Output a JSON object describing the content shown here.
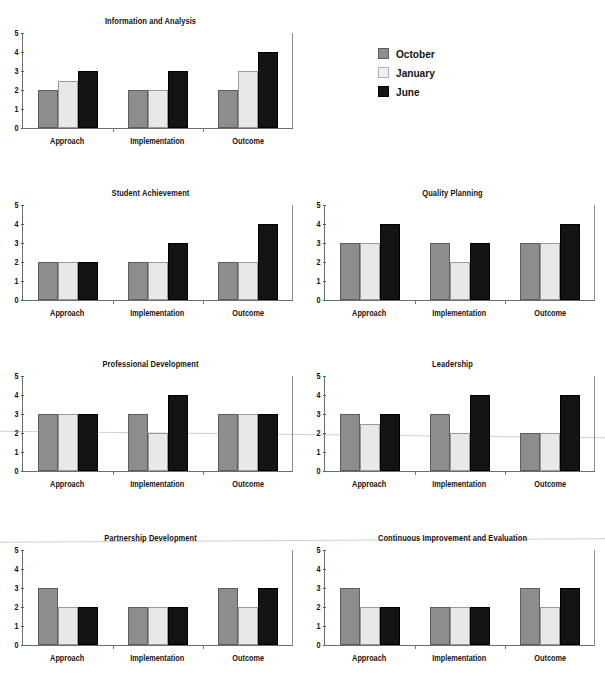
{
  "figure": {
    "series_names": [
      "October",
      "January",
      "June"
    ],
    "categories": [
      "Approach",
      "Implementation",
      "Outcome"
    ],
    "y_ticks": [
      "5",
      "4",
      "3",
      "2",
      "1",
      "0"
    ],
    "colors": {
      "october": "#8d8d8d",
      "january": "#e8e8e8",
      "june": "#141414",
      "axis": "#6d6d6d",
      "text": "#141414",
      "background": "#ffffff"
    }
  },
  "legend": {
    "position": "top-right",
    "items": [
      {
        "label": "October",
        "swatch": "october-swatch"
      },
      {
        "label": "January",
        "swatch": "january-swatch"
      },
      {
        "label": "June",
        "swatch": "june-swatch"
      }
    ]
  },
  "chart_data": [
    {
      "type": "bar",
      "title": "Information and Analysis",
      "categories": [
        "Approach",
        "Implementation",
        "Outcome"
      ],
      "series": [
        {
          "name": "October",
          "values": [
            2,
            2,
            2
          ]
        },
        {
          "name": "January",
          "values": [
            2.5,
            2,
            3
          ]
        },
        {
          "name": "June",
          "values": [
            3,
            3,
            4
          ]
        }
      ],
      "xlabel": "",
      "ylabel": "",
      "ylim": [
        0,
        5
      ],
      "yticks": [
        0,
        1,
        2,
        3,
        4,
        5
      ],
      "grid": false,
      "legend": "external-top-right"
    },
    {
      "type": "bar",
      "title": "Student Achievement",
      "categories": [
        "Approach",
        "Implementation",
        "Outcome"
      ],
      "series": [
        {
          "name": "October",
          "values": [
            2,
            2,
            2
          ]
        },
        {
          "name": "January",
          "values": [
            2,
            2,
            2
          ]
        },
        {
          "name": "June",
          "values": [
            2,
            3,
            4
          ]
        }
      ],
      "xlabel": "",
      "ylabel": "",
      "ylim": [
        0,
        5
      ],
      "yticks": [
        0,
        1,
        2,
        3,
        4,
        5
      ],
      "grid": false,
      "legend": "none"
    },
    {
      "type": "bar",
      "title": "Quality Planning",
      "categories": [
        "Approach",
        "Implementation",
        "Outcome"
      ],
      "series": [
        {
          "name": "October",
          "values": [
            3,
            3,
            3
          ]
        },
        {
          "name": "January",
          "values": [
            3,
            2,
            3
          ]
        },
        {
          "name": "June",
          "values": [
            4,
            3,
            4
          ]
        }
      ],
      "xlabel": "",
      "ylabel": "",
      "ylim": [
        0,
        5
      ],
      "yticks": [
        0,
        1,
        2,
        3,
        4,
        5
      ],
      "grid": false,
      "legend": "none"
    },
    {
      "type": "bar",
      "title": "Professional Development",
      "categories": [
        "Approach",
        "Implementation",
        "Outcome"
      ],
      "series": [
        {
          "name": "October",
          "values": [
            3,
            3,
            3
          ]
        },
        {
          "name": "January",
          "values": [
            3,
            2,
            3
          ]
        },
        {
          "name": "June",
          "values": [
            3,
            4,
            3
          ]
        }
      ],
      "xlabel": "",
      "ylabel": "",
      "ylim": [
        0,
        5
      ],
      "yticks": [
        0,
        1,
        2,
        3,
        4,
        5
      ],
      "grid": false,
      "legend": "none"
    },
    {
      "type": "bar",
      "title": "Leadership",
      "categories": [
        "Approach",
        "Implementation",
        "Outcome"
      ],
      "series": [
        {
          "name": "October",
          "values": [
            3,
            3,
            2
          ]
        },
        {
          "name": "January",
          "values": [
            2.5,
            2,
            2
          ]
        },
        {
          "name": "June",
          "values": [
            3,
            4,
            4
          ]
        }
      ],
      "xlabel": "",
      "ylabel": "",
      "ylim": [
        0,
        5
      ],
      "yticks": [
        0,
        1,
        2,
        3,
        4,
        5
      ],
      "grid": false,
      "legend": "none"
    },
    {
      "type": "bar",
      "title": "Partnership Development",
      "categories": [
        "Approach",
        "Implementation",
        "Outcome"
      ],
      "series": [
        {
          "name": "October",
          "values": [
            3,
            2,
            3
          ]
        },
        {
          "name": "January",
          "values": [
            2,
            2,
            2
          ]
        },
        {
          "name": "June",
          "values": [
            2,
            2,
            3
          ]
        }
      ],
      "xlabel": "",
      "ylabel": "",
      "ylim": [
        0,
        5
      ],
      "yticks": [
        0,
        1,
        2,
        3,
        4,
        5
      ],
      "grid": false,
      "legend": "none"
    },
    {
      "type": "bar",
      "title": "Continuous Improvement and Evaluation",
      "categories": [
        "Approach",
        "Implementation",
        "Outcome"
      ],
      "series": [
        {
          "name": "October",
          "values": [
            3,
            2,
            3
          ]
        },
        {
          "name": "January",
          "values": [
            2,
            2,
            2
          ]
        },
        {
          "name": "June",
          "values": [
            2,
            2,
            3
          ]
        }
      ],
      "xlabel": "",
      "ylabel": "",
      "ylim": [
        0,
        5
      ],
      "yticks": [
        0,
        1,
        2,
        3,
        4,
        5
      ],
      "grid": false,
      "legend": "none"
    }
  ]
}
